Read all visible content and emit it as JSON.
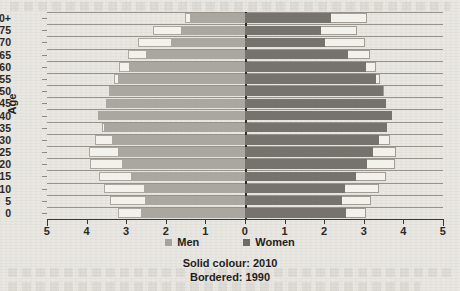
{
  "chart_data": {
    "type": "bar",
    "subtype": "population-pyramid",
    "title": "",
    "xlabel": "",
    "ylabel": "Age",
    "xlim": [
      -5,
      5
    ],
    "x_ticks": [
      "5",
      "4",
      "3",
      "2",
      "1",
      "0",
      "1",
      "2",
      "3",
      "4",
      "5"
    ],
    "x_tick_values": [
      -5,
      -4,
      -3,
      -2,
      -1,
      0,
      1,
      2,
      3,
      4,
      5
    ],
    "grid": true,
    "legend_position": "bottom",
    "categories": [
      "0",
      "5",
      "10",
      "15",
      "20",
      "25",
      "30",
      "35",
      "40",
      "45",
      "50",
      "55",
      "60",
      "65",
      "70",
      "75",
      "80+"
    ],
    "series": [
      {
        "name": "Men",
        "year": "2010",
        "style": "solid",
        "color": "#aaa6a0",
        "values": [
          2.62,
          2.52,
          2.55,
          2.88,
          3.1,
          3.22,
          3.35,
          3.55,
          3.7,
          3.5,
          3.42,
          3.22,
          2.92,
          2.5,
          1.88,
          1.62,
          1.4
        ]
      },
      {
        "name": "Men",
        "year": "1990",
        "style": "bordered",
        "color": "#f3f1ec",
        "values": [
          3.2,
          3.42,
          3.55,
          3.7,
          3.92,
          3.95,
          3.78,
          3.6,
          3.72,
          3.52,
          3.44,
          3.3,
          3.18,
          2.95,
          2.7,
          2.32,
          1.52
        ]
      },
      {
        "name": "Women",
        "year": "2010",
        "style": "solid",
        "color": "#76736e",
        "values": [
          2.55,
          2.45,
          2.52,
          2.8,
          3.08,
          3.22,
          3.38,
          3.58,
          3.72,
          3.55,
          3.48,
          3.3,
          3.05,
          2.6,
          2.02,
          1.92,
          2.18
        ]
      },
      {
        "name": "Women",
        "year": "1990",
        "style": "bordered",
        "color": "#f3f1ec",
        "values": [
          3.05,
          3.18,
          3.38,
          3.55,
          3.78,
          3.8,
          3.65,
          3.55,
          3.68,
          3.55,
          3.52,
          3.42,
          3.3,
          3.15,
          3.02,
          2.82,
          3.08
        ]
      }
    ],
    "legend": [
      {
        "label": "Men",
        "color": "#a6a29c"
      },
      {
        "label": "Women",
        "color": "#6f6c67"
      }
    ],
    "caption_lines": [
      "Solid colour: 2010",
      "Bordered: 1990"
    ]
  }
}
